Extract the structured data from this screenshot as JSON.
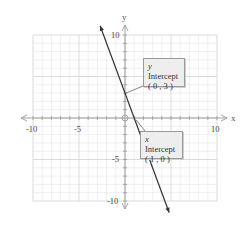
{
  "chart_data": {
    "type": "line",
    "title": "",
    "xlabel": "x",
    "ylabel": "y",
    "xlim": [
      -10,
      10
    ],
    "ylim": [
      -10,
      10
    ],
    "grid": true,
    "x_ticks": [
      -10,
      -5,
      5,
      10
    ],
    "y_ticks": [
      10,
      5,
      -5,
      -10
    ],
    "x_tick_labels": [
      "-10",
      "-5",
      "10"
    ],
    "y_tick_labels": [
      "10",
      "5",
      "-5",
      "-10"
    ],
    "series": [
      {
        "name": "y = -3x + 3",
        "x": [
          -2.7,
          4.8
        ],
        "y": [
          11.1,
          -11.4
        ],
        "color": "#333333",
        "arrows": "both"
      }
    ],
    "annotations": [
      {
        "label_var": "y",
        "label_text": "Intercept",
        "coords": "( 0 , 3 )",
        "point": [
          0,
          3
        ]
      },
      {
        "label_var": "x",
        "label_text": "Intercept",
        "coords": "( 1 , 0 )",
        "point": [
          1,
          0
        ]
      }
    ]
  },
  "axes": {
    "x_label": "x",
    "y_label": "y",
    "x_tick_labels": {
      "neg10": "-10",
      "neg5": "-5",
      "pos10": "10"
    },
    "y_tick_labels": {
      "pos10": "10",
      "neg5": "-5",
      "neg10": "-10"
    }
  },
  "callouts": {
    "y_intercept": {
      "var": "y",
      "text": " Intercept",
      "coords": "( 0 , 3 )"
    },
    "x_intercept": {
      "var": "x",
      "text": " Intercept",
      "coords": "( 1 , 0 )"
    }
  }
}
